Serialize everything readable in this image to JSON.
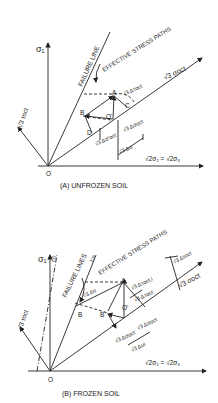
{
  "panel_a": {
    "caption": "(A)  UNFROZEN SOIL",
    "sigma1_label": "σ₁",
    "failure_line_label": "FAILURE LINE",
    "effective_stress_paths_label": "EFFECTIVE STRESS PATHS",
    "hydrostatic_axis_label": "√3 σoct",
    "horizontal_axis_label": "√2σ₂ = √2σ₃",
    "tau_axis_label": "√3 τoct",
    "origin_label": "O",
    "point_labels": {
      "A": "A",
      "B": "B",
      "C": "C",
      "D": "D",
      "O_prime": "O'"
    },
    "delta_tau_label": "√3 Δτoct",
    "delta_sigma_label": "√3 Δσoct",
    "delta_sigma_eff_label": "√3 Δσ'oct",
    "delta_u_label": "√3 Δu"
  },
  "panel_b": {
    "caption": "(B)  FROZEN SOIL",
    "sigma1_label": "σ₁",
    "t0_label": "t:0",
    "tinf_label": "t:∞",
    "failure_lines_label": "FAILURE LINES",
    "effective_stress_paths_label": "EFFECTIVE STRESS PATHS",
    "hydrostatic_axis_label": "√3 σoct",
    "horizontal_axis_label": "√2σ₂ = √2σ₃",
    "tau_axis_label": "√3 τoct",
    "origin_label": "O",
    "point_labels": {
      "A": "A",
      "B": "B",
      "B_prime": "B'",
      "O_prime": "O'"
    },
    "delta_tau_label": "√3 Δτoct",
    "delta_tau_i_label": "√3 Δτoct,i",
    "delta_tau_f_label": "√3 Δτoct",
    "delta_sigma_label": "√3 Δσoct",
    "delta_sigma_eff_label": "√3 Δσoct",
    "delta_u_label": "√3 Δu",
    "delta_ui_label": "√3 Δui"
  }
}
